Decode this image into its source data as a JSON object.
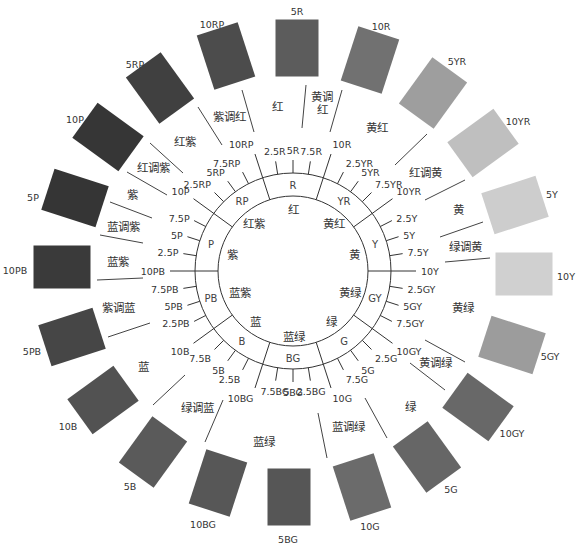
{
  "center_note": "",
  "wheel": {
    "ticks": [
      "10Y",
      "7.5Y",
      "5Y",
      "2.5Y",
      "10YR",
      "7.5YR",
      "5YR",
      "2.5YR",
      "10R",
      "7.5R",
      "5R",
      "2.5R",
      "10RP",
      "7.5RP",
      "5RP",
      "2.5RP",
      "10P",
      "7.5P",
      "5P",
      "2.5P",
      "10PB",
      "7.5PB",
      "5PB",
      "2.5PB",
      "10B",
      "7.5B",
      "5B",
      "2.5B",
      "10BG",
      "7.5BG",
      "5BG",
      "2.5BG",
      "10G",
      "7.5G",
      "5G",
      "2.5G",
      "10GY",
      "7.5GY",
      "5GY",
      "2.5GY"
    ],
    "ring_labels": {
      "R": "R",
      "YR": "YR",
      "Y": "Y",
      "GY": "GY",
      "G": "G",
      "BG": "BG",
      "B": "B",
      "PB": "PB",
      "P": "P",
      "RP": "RP"
    },
    "inner_labels": {
      "R": "红",
      "YR": "黄红",
      "Y": "黄",
      "GY": "黄绿",
      "G": "绿",
      "BG": "蓝绿",
      "B": "蓝",
      "PB": "蓝紫",
      "P": "紫",
      "RP": "红紫"
    },
    "region_labels": {
      "rp_r": "紫调红",
      "r": "红",
      "yr_r_1": "黄调",
      "yr_r_2": "红",
      "yr": "黄红",
      "r_y": "红调黄",
      "y": "黄",
      "gy_y": "绿调黄",
      "gy": "黄绿",
      "y_g": "黄调绿",
      "g": "绿",
      "b_g": "蓝调绿",
      "bg": "蓝绿",
      "g_b": "绿调蓝",
      "b": "蓝",
      "p_b": "紫调蓝",
      "pb": "蓝紫",
      "b_p": "蓝调紫",
      "p": "紫",
      "r_p": "红调紫",
      "rp": "红紫"
    }
  },
  "swatches": [
    {
      "hue": "5R",
      "color": "#5c5c5c"
    },
    {
      "hue": "10R",
      "color": "#717171"
    },
    {
      "hue": "5YR",
      "color": "#9e9e9e"
    },
    {
      "hue": "10YR",
      "color": "#bfbfbf"
    },
    {
      "hue": "5Y",
      "color": "#cdcdcd"
    },
    {
      "hue": "10Y",
      "color": "#d0d0d0"
    },
    {
      "hue": "5GY",
      "color": "#9c9c9c"
    },
    {
      "hue": "10GY",
      "color": "#686868"
    },
    {
      "hue": "5G",
      "color": "#666666"
    },
    {
      "hue": "10G",
      "color": "#6b6b6b"
    },
    {
      "hue": "5BG",
      "color": "#565656"
    },
    {
      "hue": "10BG",
      "color": "#575757"
    },
    {
      "hue": "5B",
      "color": "#5a5a5a"
    },
    {
      "hue": "10B",
      "color": "#525252"
    },
    {
      "hue": "5PB",
      "color": "#464646"
    },
    {
      "hue": "10PB",
      "color": "#3a3a3a"
    },
    {
      "hue": "5P",
      "color": "#353535"
    },
    {
      "hue": "10P",
      "color": "#363636"
    },
    {
      "hue": "5RP",
      "color": "#404040"
    },
    {
      "hue": "10RP",
      "color": "#4c4c4c"
    }
  ]
}
